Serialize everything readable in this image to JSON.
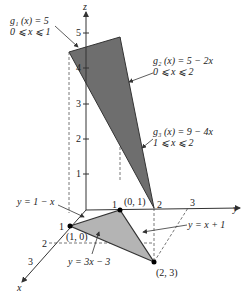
{
  "figure": {
    "axes": {
      "x_label": "x",
      "y_label": "y",
      "z_label": "z",
      "z_ticks": [
        "1",
        "2",
        "3",
        "4",
        "5"
      ],
      "y_ticks": [
        "1",
        "2",
        "3"
      ],
      "x_ticks": [
        "1",
        "2",
        "3"
      ]
    },
    "annotations": {
      "g1_eq": "g₁ (x) = 5",
      "g1_dom": "0 ⩽ x ⩽ 1",
      "g2_eq": "g₂ (x) = 5 − 2x",
      "g2_dom": "0 ⩽ x ⩽ 2",
      "g3_eq": "g₃ (x) = 9 − 4x",
      "g3_dom": "1 ⩽ x ⩽ 2",
      "line_a": "y = 1 − x",
      "line_b": "y = 3x − 3",
      "line_c": "y = x + 1"
    },
    "points": {
      "p1": "(1, 0)",
      "p2": "(0, 1)",
      "p3": "(2, 3)"
    },
    "colors": {
      "upper_surface": "#6e6e6e",
      "base_region": "#b4b4b4",
      "axis": "#333333"
    }
  }
}
